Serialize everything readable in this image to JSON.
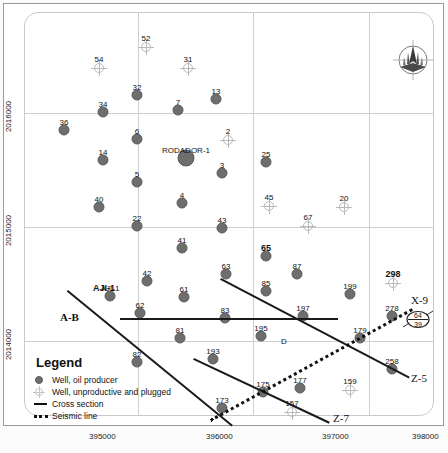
{
  "map": {
    "title_label": "RODADOR-1",
    "axis": {
      "x_ticks": [
        "395000",
        "396000",
        "397000",
        "398000"
      ],
      "y_ticks": [
        "2016000",
        "2015000",
        "2014000"
      ]
    },
    "annotations": {
      "aji": "AJI-1",
      "ab": "A-B",
      "d_marker": "D",
      "x9": "X-9",
      "z5": "Z-5",
      "z7": "Z-7",
      "oval_top": "64",
      "oval_bottom": "39"
    },
    "compass_name": "north-arrow-compass"
  },
  "legend": {
    "title": "Legend",
    "items": [
      {
        "symbol": "well-oil-producer-symbol",
        "label": "Well, oil producer"
      },
      {
        "symbol": "well-unproductive-plugged-symbol",
        "label": "Well, unproductive and plugged"
      },
      {
        "symbol": "cross-section-symbol",
        "label": "Cross section"
      },
      {
        "symbol": "seismic-line-symbol",
        "label": "Seismic line"
      }
    ]
  },
  "chart_data": {
    "type": "scatter",
    "xlabel": "Easting (m)",
    "ylabel": "Northing (m)",
    "xlim": [
      394700,
      398300
    ],
    "ylim": [
      2013500,
      2016800
    ],
    "grid": true,
    "legend_position": "bottom-left",
    "series": [
      {
        "name": "Well, oil producer",
        "points": [
          {
            "label": "32",
            "px": 137,
            "py": 95
          },
          {
            "label": "34",
            "px": 103,
            "py": 112
          },
          {
            "label": "13",
            "px": 216,
            "py": 99
          },
          {
            "label": "7",
            "px": 178,
            "py": 110
          },
          {
            "label": "36",
            "px": 64,
            "py": 130
          },
          {
            "label": "6",
            "px": 137,
            "py": 139
          },
          {
            "label": "RODADOR-1",
            "px": 186,
            "py": 158,
            "big": true
          },
          {
            "label": "14",
            "px": 103,
            "py": 160
          },
          {
            "label": "3",
            "px": 222,
            "py": 173
          },
          {
            "label": "25",
            "px": 266,
            "py": 162
          },
          {
            "label": "5",
            "px": 137,
            "py": 182
          },
          {
            "label": "40",
            "px": 99,
            "py": 207
          },
          {
            "label": "4",
            "px": 182,
            "py": 203
          },
          {
            "label": "22",
            "px": 137,
            "py": 226
          },
          {
            "label": "43",
            "px": 222,
            "py": 228
          },
          {
            "label": "41",
            "px": 182,
            "py": 248
          },
          {
            "label": "65",
            "px": 266,
            "py": 256,
            "bold": true
          },
          {
            "label": "42",
            "px": 147,
            "py": 281
          },
          {
            "label": "63",
            "px": 226,
            "py": 274
          },
          {
            "label": "87",
            "px": 297,
            "py": 274
          },
          {
            "label": "61",
            "px": 184,
            "py": 297
          },
          {
            "label": "85",
            "px": 266,
            "py": 291
          },
          {
            "label": "AJI-1",
            "px": 110,
            "py": 296
          },
          {
            "label": "199",
            "px": 350,
            "py": 294
          },
          {
            "label": "62",
            "px": 140,
            "py": 313
          },
          {
            "label": "83",
            "px": 225,
            "py": 318
          },
          {
            "label": "197",
            "px": 303,
            "py": 316
          },
          {
            "label": "278",
            "px": 392,
            "py": 316
          },
          {
            "label": "179",
            "px": 360,
            "py": 338
          },
          {
            "label": "81",
            "px": 180,
            "py": 338
          },
          {
            "label": "195",
            "px": 261,
            "py": 336
          },
          {
            "label": "258",
            "px": 392,
            "py": 369
          },
          {
            "label": "82",
            "px": 137,
            "py": 362
          },
          {
            "label": "193",
            "px": 213,
            "py": 359
          },
          {
            "label": "177",
            "px": 300,
            "py": 388
          },
          {
            "label": "175",
            "px": 263,
            "py": 392
          },
          {
            "label": "173",
            "px": 222,
            "py": 408
          }
        ]
      },
      {
        "name": "Well, unproductive and plugged",
        "points": [
          {
            "label": "52",
            "px": 146,
            "py": 47
          },
          {
            "label": "54",
            "px": 99,
            "py": 68
          },
          {
            "label": "31",
            "px": 188,
            "py": 68
          },
          {
            "label": "2",
            "px": 228,
            "py": 140
          },
          {
            "label": "45",
            "px": 269,
            "py": 206
          },
          {
            "label": "20",
            "px": 344,
            "py": 207
          },
          {
            "label": "67",
            "px": 308,
            "py": 226
          },
          {
            "label": "298",
            "px": 393,
            "py": 283,
            "bold": true
          },
          {
            "label": "159",
            "px": 350,
            "py": 390
          },
          {
            "label": "157",
            "px": 292,
            "py": 412
          }
        ]
      }
    ],
    "cross_sections": [
      {
        "name": "AJI-1",
        "x1": 68,
        "y1": 290,
        "x2": 233,
        "y2": 425
      },
      {
        "name": "A-B",
        "x1": 120,
        "y1": 318,
        "x2": 338,
        "y2": 318
      },
      {
        "name": "Z-5",
        "x1": 221,
        "y1": 278,
        "x2": 410,
        "y2": 377
      },
      {
        "name": "Z-7",
        "x1": 194,
        "y1": 358,
        "x2": 330,
        "y2": 422
      }
    ],
    "seismic_lines": [
      {
        "name": "X-9",
        "x1": 210,
        "y1": 419,
        "x2": 412,
        "y2": 308
      }
    ]
  }
}
